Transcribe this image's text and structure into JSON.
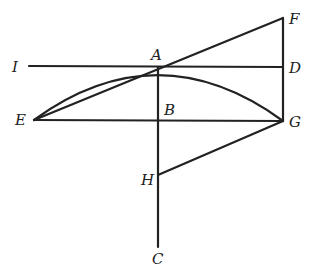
{
  "diagram": {
    "type": "geometric-construction",
    "labels": {
      "I": "I",
      "A": "A",
      "D": "D",
      "F": "F",
      "E": "E",
      "B": "B",
      "G": "G",
      "H": "H",
      "C": "C"
    },
    "segments": [
      [
        "I",
        "D"
      ],
      [
        "E",
        "G"
      ],
      [
        "A",
        "C"
      ],
      [
        "F",
        "G"
      ],
      [
        "E",
        "F"
      ],
      [
        "H",
        "G"
      ]
    ],
    "arcs": [
      [
        "E",
        "A",
        "G"
      ]
    ]
  }
}
